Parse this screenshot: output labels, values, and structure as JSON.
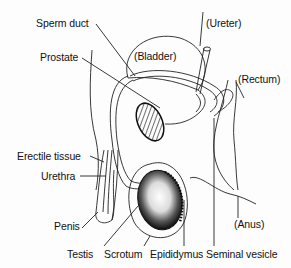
{
  "diagram": {
    "labels": {
      "sperm_duct": "Sperm duct",
      "ureter": "(Ureter)",
      "bladder": "(Bladder)",
      "prostate": "Prostate",
      "rectum": "(Rectum)",
      "erectile_tissue": "Erectile tissue",
      "urethra": "Urethra",
      "penis": "Penis",
      "anus": "(Anus)",
      "testis": "Testis",
      "scrotum": "Scrotum",
      "epididymus": "Epididymus",
      "seminal_vesicle": "Seminal vesicle"
    },
    "colors": {
      "line": "#222222",
      "fill_dark": "#111111",
      "background": "#fdfdfd"
    }
  }
}
